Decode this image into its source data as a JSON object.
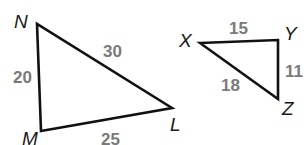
{
  "diagram": {
    "type": "similar-triangles",
    "triangles": [
      {
        "name": "triangle-NML",
        "vertices": {
          "N": {
            "label": "N",
            "x": 37,
            "y": 24
          },
          "M": {
            "label": "M",
            "x": 41,
            "y": 131
          },
          "L": {
            "label": "L",
            "x": 172,
            "y": 108
          }
        },
        "sides": {
          "NM": "20",
          "NL": "30",
          "ML": "25"
        }
      },
      {
        "name": "triangle-XYZ",
        "vertices": {
          "X": {
            "label": "X",
            "x": 200,
            "y": 43
          },
          "Y": {
            "label": "Y",
            "x": 278,
            "y": 40
          },
          "Z": {
            "label": "Z",
            "x": 278,
            "y": 99
          }
        },
        "sides": {
          "XY": "15",
          "YZ": "11",
          "XZ": "18"
        }
      }
    ],
    "colors": {
      "edge": "#111111",
      "vertex_label": "#1a1a1a",
      "side_label": "#7a7a7a"
    }
  }
}
